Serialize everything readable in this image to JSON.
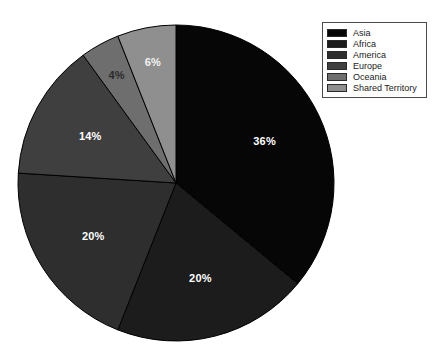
{
  "chart_data": {
    "type": "pie",
    "title": "",
    "labels": [
      "Asia",
      "Africa",
      "America",
      "Europe",
      "Oceania",
      "Shared Territory"
    ],
    "values": [
      36,
      20,
      20,
      14,
      4,
      6
    ],
    "value_labels": [
      "36%",
      "20%",
      "20%",
      "14%",
      "4%",
      "6%"
    ],
    "colors": [
      "#060606",
      "#1c1c1c",
      "#2e2e2e",
      "#3f3f3f",
      "#6e6e6e",
      "#8f8f8f"
    ],
    "label_text_colors": [
      "#ffffff",
      "#ffffff",
      "#ffffff",
      "#ffffff",
      "#2a2a2a",
      "#f2f2f2"
    ],
    "start_angle_deg": 0,
    "direction": "clockwise",
    "legend_position": "top-right",
    "grid": false,
    "xlabel": "",
    "ylabel": ""
  },
  "legend": {
    "entries": [
      {
        "label": "Asia",
        "color": "#060606"
      },
      {
        "label": "Africa",
        "color": "#1c1c1c"
      },
      {
        "label": "America",
        "color": "#2e2e2e"
      },
      {
        "label": "Europe",
        "color": "#3f3f3f"
      },
      {
        "label": "Oceania",
        "color": "#6e6e6e"
      },
      {
        "label": "Shared Territory",
        "color": "#8f8f8f"
      }
    ]
  },
  "geometry": {
    "center_x": 176,
    "center_y": 183,
    "radius": 158
  }
}
